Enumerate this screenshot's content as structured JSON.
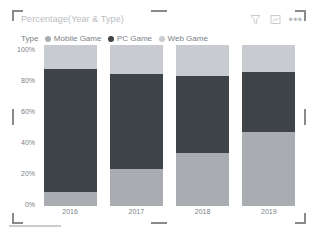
{
  "visual": {
    "title": "Percentage(Year & Type)",
    "header_icons": [
      {
        "name": "filter-icon",
        "label": "Filters"
      },
      {
        "name": "focus-mode-icon",
        "label": "Focus mode"
      },
      {
        "name": "more-options-icon",
        "label": "More options"
      }
    ],
    "more_options_glyph": "•••"
  },
  "legend": {
    "title": "Type",
    "items": [
      {
        "label": "Mobile Game",
        "color": "#a9adb1"
      },
      {
        "label": "PC Game",
        "color": "#3f4448"
      },
      {
        "label": "Web Game",
        "color": "#c8ccd0"
      }
    ]
  },
  "axes": {
    "y_ticks": [
      "100%",
      "80%",
      "60%",
      "40%",
      "20%",
      "0%"
    ],
    "x_ticks": [
      "2016",
      "2017",
      "2018",
      "2019"
    ]
  },
  "bottom": {
    "status_text": ""
  },
  "chart_data": {
    "type": "bar",
    "stacked": true,
    "stack_mode": "100-percent",
    "title": "Percentage(Year & Type)",
    "xlabel": "",
    "ylabel": "",
    "ylim": [
      0,
      100
    ],
    "grid": false,
    "legend_position": "top",
    "legend_title": "Type",
    "categories": [
      "2016",
      "2017",
      "2018",
      "2019"
    ],
    "series": [
      {
        "name": "Mobile Game",
        "color": "#a9adb1",
        "values": [
          9,
          23,
          33,
          46
        ]
      },
      {
        "name": "PC Game",
        "color": "#3f4448",
        "values": [
          76,
          59,
          48,
          37
        ]
      },
      {
        "name": "Web Game",
        "color": "#c8ccd0",
        "values": [
          15,
          18,
          19,
          17
        ]
      }
    ]
  }
}
